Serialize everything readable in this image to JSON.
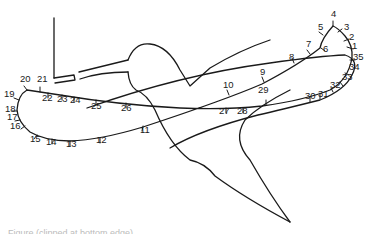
{
  "figure": {
    "type": "wing-tip trajectory of hovering hummingbird",
    "stroke_color": "#1a1a1a",
    "background": "#ffffff",
    "point_labels": [
      {
        "n": "1",
        "x": 352,
        "y": 49
      },
      {
        "n": "2",
        "x": 349,
        "y": 40
      },
      {
        "n": "3",
        "x": 344,
        "y": 30
      },
      {
        "n": "4",
        "x": 333,
        "y": 17
      },
      {
        "n": "5",
        "x": 318,
        "y": 30
      },
      {
        "n": "6",
        "x": 323,
        "y": 52
      },
      {
        "n": "7",
        "x": 306,
        "y": 47
      },
      {
        "n": "8",
        "x": 290,
        "y": 60
      },
      {
        "n": "9",
        "x": 262,
        "y": 75
      },
      {
        "n": "10",
        "x": 225,
        "y": 88
      },
      {
        "n": "11",
        "x": 143,
        "y": 132
      },
      {
        "n": "12",
        "x": 97,
        "y": 142
      },
      {
        "n": "13",
        "x": 67,
        "y": 146
      },
      {
        "n": "14",
        "x": 47,
        "y": 144
      },
      {
        "n": "15",
        "x": 31,
        "y": 141
      },
      {
        "n": "16",
        "x": 14,
        "y": 128
      },
      {
        "n": "17",
        "x": 12,
        "y": 119
      },
      {
        "n": "18",
        "x": 8,
        "y": 110
      },
      {
        "n": "19",
        "x": 8,
        "y": 95
      },
      {
        "n": "20",
        "x": 19,
        "y": 80
      },
      {
        "n": "21",
        "x": 37,
        "y": 81
      },
      {
        "n": "22",
        "x": 41,
        "y": 100
      },
      {
        "n": "23",
        "x": 56,
        "y": 101
      },
      {
        "n": "24",
        "x": 70,
        "y": 102
      },
      {
        "n": "25",
        "x": 92,
        "y": 108
      },
      {
        "n": "26",
        "x": 120,
        "y": 110
      },
      {
        "n": "27",
        "x": 224,
        "y": 113
      },
      {
        "n": "28",
        "x": 241,
        "y": 113
      },
      {
        "n": "29",
        "x": 258,
        "y": 92
      },
      {
        "n": "30",
        "x": 305,
        "y": 98
      },
      {
        "n": "31",
        "x": 317,
        "y": 96
      },
      {
        "n": "32",
        "x": 329,
        "y": 86
      },
      {
        "n": "33",
        "x": 341,
        "y": 78
      },
      {
        "n": "34",
        "x": 348,
        "y": 69
      },
      {
        "n": "35",
        "x": 352,
        "y": 58
      }
    ],
    "caption_visible": "Figure (clipped at bottom edge)"
  }
}
